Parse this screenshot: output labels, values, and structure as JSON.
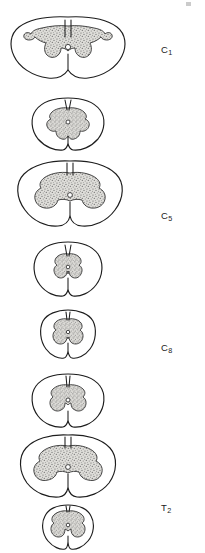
{
  "figure": {
    "orientation": "vertical stack, labels at right",
    "colors": {
      "background": "#ffffff",
      "outline": "#1d1d1d",
      "white_matter_fill": "#ffffff",
      "gray_matter_fill": "#d8d6d2",
      "gray_matter_stipple": "#6b6b6b",
      "label_text": "#1a1a1a"
    },
    "corner_mark": "crop-artifact"
  },
  "sections": [
    {
      "id": "c1",
      "label": "C",
      "subscript": "1",
      "label_full": "C1",
      "region": "cervical",
      "order": 1,
      "width_px": 120,
      "height_px": 72,
      "center_x": 68,
      "top_y": 14,
      "label_x": 161,
      "label_y": 45,
      "shape": "very wide oval, broad butterfly gray matter with slender horns",
      "relative_size": "largest diameter"
    },
    {
      "id": "c5",
      "label": "C",
      "subscript": "5",
      "label_full": "C5",
      "region": "cervical",
      "order": 2,
      "width_px": 78,
      "height_px": 58,
      "center_x": 68,
      "top_y": 96,
      "label_x": 161,
      "label_y": 120,
      "shape": "rounded oval, compact H-shaped gray matter",
      "relative_size": "small"
    },
    {
      "id": "c8",
      "label": "C",
      "subscript": "8",
      "label_full": "C8",
      "region": "cervical",
      "order": 3,
      "width_px": 112,
      "height_px": 76,
      "center_x": 68,
      "top_y": 158,
      "label_x": 161,
      "label_y": 190,
      "shape": "wide oval, massive bulky ventral horns (cervical enlargement)",
      "relative_size": "large"
    },
    {
      "id": "t2",
      "label": "T",
      "subscript": "2",
      "label_full": "T2",
      "region": "thoracic",
      "order": 4,
      "width_px": 72,
      "height_px": 60,
      "center_x": 68,
      "top_y": 240,
      "label_x": 161,
      "label_y": 268,
      "shape": "oval, narrow slender H-shaped gray matter",
      "relative_size": "small"
    },
    {
      "id": "t7",
      "label": "T",
      "subscript": "7",
      "label_full": "T7",
      "region": "thoracic",
      "order": 5,
      "width_px": 58,
      "height_px": 54,
      "center_x": 68,
      "top_y": 308,
      "label_x": 161,
      "label_y": 336,
      "shape": "nearly circular, thin gray matter",
      "relative_size": "smallest"
    },
    {
      "id": "l1",
      "label": "L",
      "subscript": "1",
      "label_full": "L1",
      "region": "lumbar",
      "order": 6,
      "width_px": 76,
      "height_px": 58,
      "center_x": 68,
      "top_y": 372,
      "label_x": 161,
      "label_y": 400,
      "shape": "rounded oval, moderately thick gray matter",
      "relative_size": "small"
    },
    {
      "id": "l6",
      "label": "L",
      "subscript": "6",
      "label_full": "L6",
      "region": "lumbar",
      "order": 7,
      "width_px": 100,
      "height_px": 72,
      "center_x": 68,
      "top_y": 432,
      "label_x": 161,
      "label_y": 463,
      "shape": "wide oval, very large bulky gray matter (lumbar enlargement)",
      "relative_size": "large"
    },
    {
      "id": "s1",
      "label": "S",
      "subscript": "1",
      "label_full": "S1",
      "region": "sacral",
      "order": 8,
      "width_px": 54,
      "height_px": 48,
      "center_x": 68,
      "top_y": 503,
      "label_x": 161,
      "label_y": 528,
      "shape": "small rounded, gray matter fills most of the section",
      "relative_size": "small with proportionally largest gray matter"
    }
  ]
}
